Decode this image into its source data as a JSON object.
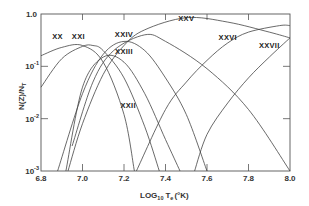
{
  "chart_data": {
    "type": "line",
    "title": "",
    "xlabel": "LOG10 Te (°K)",
    "ylabel": "N(Z)/NT",
    "xlim": [
      6.8,
      8.0
    ],
    "ylim": [
      0.001,
      1.0
    ],
    "yscale": "log",
    "grid": false,
    "x_ticks": [
      "6.8",
      "7.0",
      "7.2",
      "7.4",
      "7.6",
      "7.8",
      "8.0"
    ],
    "y_ticks": [
      {
        "base": "1.0",
        "exp": ""
      },
      {
        "base": "10",
        "exp": "-1"
      },
      {
        "base": "10",
        "exp": "-2"
      },
      {
        "base": "10",
        "exp": "-3"
      }
    ],
    "series": [
      {
        "name": "XX",
        "x": [
          6.8,
          6.9,
          7.0,
          7.1,
          7.2,
          7.25
        ],
        "values": [
          0.16,
          0.23,
          0.25,
          0.12,
          0.012,
          0.001
        ]
      },
      {
        "name": "XXI",
        "x": [
          6.8,
          6.9,
          7.0,
          7.05,
          7.1,
          7.2,
          7.3,
          7.37
        ],
        "values": [
          0.04,
          0.14,
          0.24,
          0.25,
          0.2,
          0.06,
          0.007,
          0.001
        ]
      },
      {
        "name": "XXII",
        "x": [
          6.92,
          7.0,
          7.1,
          7.2,
          7.3,
          7.4,
          7.47
        ],
        "values": [
          0.001,
          0.04,
          0.15,
          0.12,
          0.03,
          0.004,
          0.001
        ]
      },
      {
        "name": "XXIII",
        "x": [
          6.88,
          7.0,
          7.1,
          7.2,
          7.3,
          7.4,
          7.5,
          7.6
        ],
        "values": [
          0.001,
          0.03,
          0.17,
          0.3,
          0.2,
          0.06,
          0.012,
          0.001
        ]
      },
      {
        "name": "XXIV",
        "x": [
          6.95,
          7.05,
          7.15,
          7.3,
          7.4,
          7.6,
          7.8,
          8.0
        ],
        "values": [
          0.003,
          0.05,
          0.2,
          0.4,
          0.3,
          0.09,
          0.015,
          0.001
        ]
      },
      {
        "name": "XXV",
        "x": [
          6.93,
          7.0,
          7.1,
          7.2,
          7.3,
          7.5,
          7.7,
          7.9,
          8.0
        ],
        "values": [
          0.001,
          0.008,
          0.07,
          0.25,
          0.5,
          0.85,
          0.7,
          0.45,
          0.35
        ]
      },
      {
        "name": "XXVI",
        "x": [
          7.26,
          7.4,
          7.5,
          7.6,
          7.7,
          7.8,
          7.95,
          8.0
        ],
        "values": [
          0.001,
          0.015,
          0.05,
          0.13,
          0.28,
          0.45,
          0.6,
          0.6
        ]
      },
      {
        "name": "XXVII",
        "x": [
          7.54,
          7.6,
          7.7,
          7.8,
          7.9,
          8.0
        ],
        "values": [
          0.001,
          0.005,
          0.02,
          0.06,
          0.15,
          0.35
        ]
      }
    ],
    "annotations": [
      {
        "text": "XX",
        "x": 6.88,
        "y": 0.33
      },
      {
        "text": "XXI",
        "x": 6.98,
        "y": 0.33
      },
      {
        "text": "XXII",
        "x": 7.22,
        "y": 0.016
      },
      {
        "text": "XXIII",
        "x": 7.2,
        "y": 0.17
      },
      {
        "text": "XXIV",
        "x": 7.2,
        "y": 0.37
      },
      {
        "text": "XXV",
        "x": 7.5,
        "y": 0.75
      },
      {
        "text": "XXVI",
        "x": 7.7,
        "y": 0.32
      },
      {
        "text": "XXVII",
        "x": 7.9,
        "y": 0.22
      }
    ],
    "legend_position": "none"
  },
  "axes": {
    "x_label_prefix": "LOG",
    "x_label_sub": "10",
    "x_label_var": "T",
    "x_label_var_sub": "e",
    "x_label_unit": "(°K)",
    "y_label": "N(Z)/N",
    "y_label_sub": "T"
  },
  "colors": {
    "line": "#444444",
    "frame": "#555555",
    "background": "#ffffff"
  }
}
